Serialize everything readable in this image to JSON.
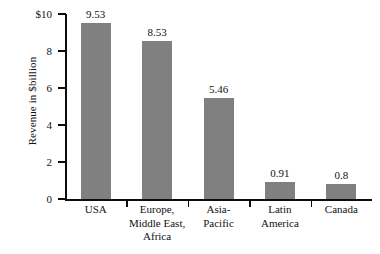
{
  "chart_data": {
    "type": "bar",
    "title": "",
    "xlabel": "",
    "ylabel": "Revenue in $billion",
    "ylim": [
      0,
      10
    ],
    "grid": false,
    "legend": "none",
    "categories": [
      "USA",
      "Europe, Middle East, Africa",
      "Asia-Pacific",
      "Latin America",
      "Canada"
    ],
    "category_lines": [
      [
        "USA"
      ],
      [
        "Europe,",
        "Middle East,",
        "Africa"
      ],
      [
        "Asia-",
        "Pacific"
      ],
      [
        "Latin",
        "America"
      ],
      [
        "Canada"
      ]
    ],
    "values": [
      9.53,
      8.53,
      5.46,
      0.91,
      0.8
    ],
    "value_labels": [
      "9.53",
      "8.53",
      "5.46",
      "0.91",
      "0.8"
    ],
    "ytick_values": [
      0,
      2,
      4,
      6,
      8,
      10
    ],
    "ytick_labels": [
      "0",
      "2",
      "4",
      "6",
      "8",
      "$10"
    ],
    "bar_color": "#808080",
    "axis_color": "#0d0d0d",
    "text_color": "#111111",
    "background_color": "#ffffff"
  }
}
